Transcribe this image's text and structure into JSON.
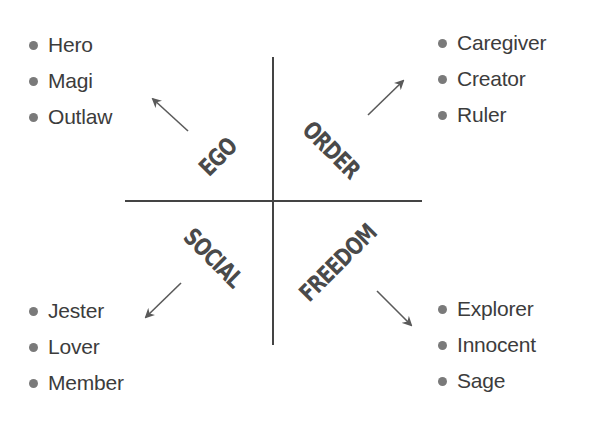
{
  "diagram": {
    "type": "quadrant",
    "quadrants": [
      {
        "id": "ego",
        "label": "EGO",
        "position": "top-left",
        "items": [
          "Hero",
          "Magi",
          "Outlaw"
        ]
      },
      {
        "id": "order",
        "label": "ORDER",
        "position": "top-right",
        "items": [
          "Caregiver",
          "Creator",
          "Ruler"
        ]
      },
      {
        "id": "social",
        "label": "SOCIAL",
        "position": "bottom-left",
        "items": [
          "Jester",
          "Lover",
          "Member"
        ]
      },
      {
        "id": "freedom",
        "label": "FREEDOM",
        "position": "bottom-right",
        "items": [
          "Explorer",
          "Innocent",
          "Sage"
        ]
      }
    ],
    "colors": {
      "text": "#3c3c3c",
      "axis": "#444444",
      "label": "#4a4a4a",
      "arrow": "#5a5a5a",
      "bullet": "#7a7a7a"
    }
  }
}
